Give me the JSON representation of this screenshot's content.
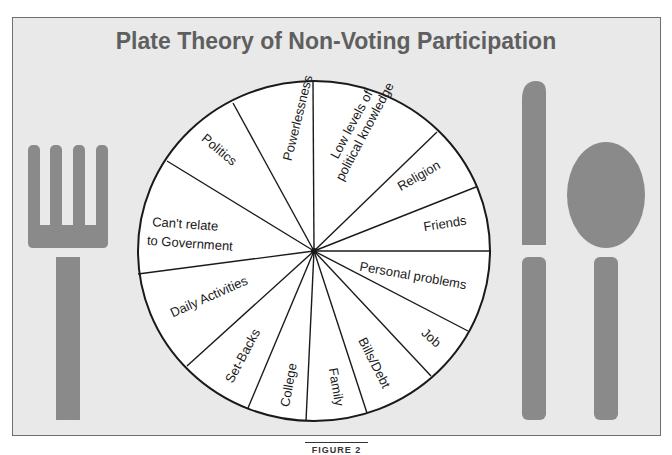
{
  "figure": {
    "title": "Plate Theory of Non-Voting Participation",
    "caption": "FIGURE 2"
  },
  "colors": {
    "background": "#e9e9e9",
    "border": "#6f6f6f",
    "utensil": "#8a8a8a",
    "plate": "#ffffff",
    "lines": "#1a1a1a",
    "title": "#5f5f5f"
  },
  "plate": {
    "center": [
      314,
      251
    ],
    "radius_x": 176,
    "radius_y": 170,
    "slices": [
      {
        "label": "Powerlessness",
        "lines": [
          "Powerlessness"
        ]
      },
      {
        "label": "Low levels of political knowledge",
        "lines": [
          "Low levels of",
          "political knowledge"
        ]
      },
      {
        "label": "Religion",
        "lines": [
          "Religion"
        ]
      },
      {
        "label": "Friends",
        "lines": [
          "Friends"
        ]
      },
      {
        "label": "Personal problems",
        "lines": [
          "Personal problems"
        ]
      },
      {
        "label": "Job",
        "lines": [
          "Job"
        ]
      },
      {
        "label": "Bills/Debt",
        "lines": [
          "Bills/Debt"
        ]
      },
      {
        "label": "Family",
        "lines": [
          "Family"
        ]
      },
      {
        "label": "College",
        "lines": [
          "College"
        ]
      },
      {
        "label": "Set-Backs",
        "lines": [
          "Set-Backs"
        ]
      },
      {
        "label": "Daily Activities",
        "lines": [
          "Daily Activities"
        ]
      },
      {
        "label": "Can't relate to Government",
        "lines": [
          "Can't relate",
          "to Government"
        ]
      },
      {
        "label": "Politics",
        "lines": [
          "Politics"
        ]
      }
    ]
  },
  "utensils": {
    "left": "fork",
    "right": [
      "knife",
      "spoon"
    ]
  }
}
